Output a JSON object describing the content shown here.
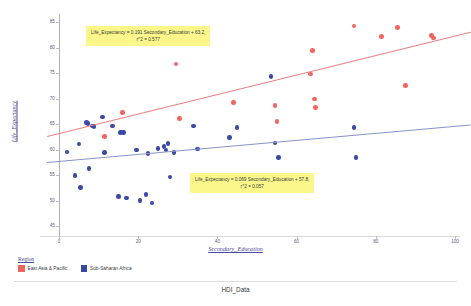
{
  "caption": "HDI_Data",
  "axes": {
    "x_title": "Secondary_Education",
    "y_title": "Life_Expectancy",
    "x_ticks": [
      "0",
      "20",
      "40",
      "60",
      "80",
      "100"
    ],
    "y_ticks": [
      "85",
      "80",
      "75",
      "70",
      "65",
      "60",
      "55",
      "50",
      "45"
    ]
  },
  "annotations": [
    {
      "line1": "Life_Expectancy = 0.191 Secondary_Education + 63.2,",
      "line2": "r^2 = 0.577"
    },
    {
      "line1": "Life_Expectancy = 0.069 Secondary_Education + 57.8,",
      "line2": "r^2 = 0.057"
    }
  ],
  "legend": {
    "title": "Region",
    "items": [
      {
        "label": "East Asia & Pacific",
        "color": "#f2655f"
      },
      {
        "label": "Sub-Saharan Africa",
        "color": "#3a49a4"
      }
    ]
  },
  "chart_data": {
    "type": "scatter",
    "title": "HDI_Data",
    "xlabel": "Secondary_Education",
    "ylabel": "Life_Expectancy",
    "xlim": [
      -3,
      104
    ],
    "ylim": [
      44,
      86.5
    ],
    "grid": false,
    "legend_position": "bottom-left",
    "series": [
      {
        "name": "East Asia & Pacific",
        "color": "#f2655f",
        "points": [
          [
            11.5,
            62.6
          ],
          [
            16.0,
            67.3
          ],
          [
            29.5,
            76.8
          ],
          [
            30.5,
            66.1
          ],
          [
            44.0,
            69.2
          ],
          [
            54.5,
            68.6
          ],
          [
            55.0,
            65.5
          ],
          [
            63.5,
            74.8
          ],
          [
            64.0,
            79.4
          ],
          [
            64.5,
            69.9
          ],
          [
            64.8,
            68.2
          ],
          [
            74.5,
            84.2
          ],
          [
            81.5,
            82.2
          ],
          [
            85.5,
            83.9
          ],
          [
            87.5,
            72.6
          ],
          [
            94.0,
            82.3
          ],
          [
            94.6,
            81.9
          ]
        ],
        "trend": {
          "slope": 0.191,
          "intercept": 63.2,
          "r2": 0.577,
          "equation": "Life_Expectancy = 0.191 Secondary_Education + 63.2,"
        }
      },
      {
        "name": "Sub-Saharan Africa",
        "color": "#3a49a4",
        "points": [
          [
            2.0,
            59.5
          ],
          [
            4.0,
            54.9
          ],
          [
            5.0,
            61.1
          ],
          [
            5.5,
            52.5
          ],
          [
            7.0,
            65.3
          ],
          [
            7.3,
            65.1
          ],
          [
            7.6,
            56.3
          ],
          [
            8.5,
            64.6
          ],
          [
            8.8,
            64.5
          ],
          [
            11.0,
            66.4
          ],
          [
            11.5,
            59.4
          ],
          [
            13.5,
            64.6
          ],
          [
            15.0,
            50.8
          ],
          [
            15.5,
            63.3
          ],
          [
            16.0,
            63.4
          ],
          [
            16.3,
            63.3
          ],
          [
            17.0,
            50.5
          ],
          [
            19.5,
            59.9
          ],
          [
            20.5,
            50.0
          ],
          [
            22.0,
            51.2
          ],
          [
            22.5,
            59.2
          ],
          [
            23.5,
            49.5
          ],
          [
            25.0,
            60.2
          ],
          [
            26.5,
            60.6
          ],
          [
            27.0,
            59.9
          ],
          [
            27.5,
            61.2
          ],
          [
            28.0,
            54.6
          ],
          [
            29.0,
            59.4
          ],
          [
            34.0,
            64.6
          ],
          [
            35.0,
            60.1
          ],
          [
            43.0,
            62.3
          ],
          [
            45.0,
            64.3
          ],
          [
            53.5,
            74.3
          ],
          [
            54.5,
            61.3
          ],
          [
            55.5,
            58.4
          ],
          [
            74.5,
            64.3
          ],
          [
            75.0,
            58.4
          ]
        ],
        "trend": {
          "slope": 0.069,
          "intercept": 57.8,
          "r2": 0.057,
          "equation": "Life_Expectancy = 0.069 Secondary_Education + 57.8,"
        }
      }
    ]
  }
}
